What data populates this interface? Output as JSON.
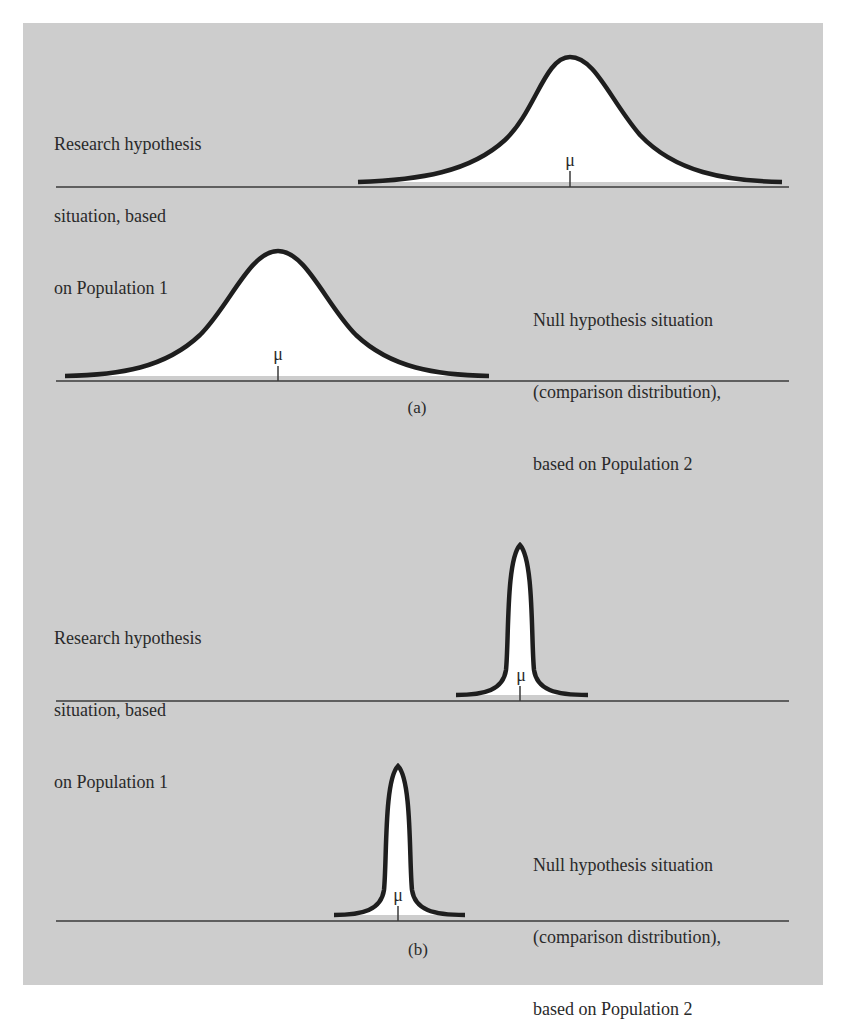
{
  "figure": {
    "background_color": "#cdcdcd",
    "curve_stroke_color": "#1e1e1e",
    "curve_fill_color": "#ffffff",
    "baseline_color": "#3a3a3a"
  },
  "panel_a": {
    "caption": "(a)",
    "research": {
      "lines": [
        "Research hypothesis",
        "situation, based",
        "on Population 1"
      ],
      "mean_label": "μ"
    },
    "null": {
      "lines": [
        "Null hypothesis situation",
        "(comparison distribution),",
        "based on Population 2"
      ],
      "mean_label": "μ"
    }
  },
  "panel_b": {
    "caption": "(b)",
    "research": {
      "lines": [
        "Research hypothesis",
        "situation, based",
        "on Population 1"
      ],
      "mean_label": "μ"
    },
    "null": {
      "lines": [
        "Null hypothesis situation",
        "(comparison distribution),",
        "based on Population 2"
      ],
      "mean_label": "μ"
    }
  }
}
